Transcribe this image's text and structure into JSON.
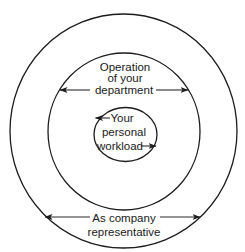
{
  "diagram": {
    "type": "concentric-circles",
    "background_color": "#ffffff",
    "line_color": "#1c1c1c",
    "rings": [
      {
        "id": "outer",
        "label_lines": [
          "As company",
          "representative"
        ],
        "label_position": "bottom",
        "arrows": "double-headed horizontal, pointing to ring edge"
      },
      {
        "id": "middle",
        "label_lines": [
          "Operation",
          "of your",
          "department"
        ],
        "label_position": "top",
        "arrows": "double-headed horizontal, pointing to ring edge"
      },
      {
        "id": "inner",
        "label_lines": [
          "Your",
          "personal",
          "workload"
        ],
        "label_position": "center",
        "arrows": "left arrow before first line, right arrow after last line"
      }
    ]
  }
}
